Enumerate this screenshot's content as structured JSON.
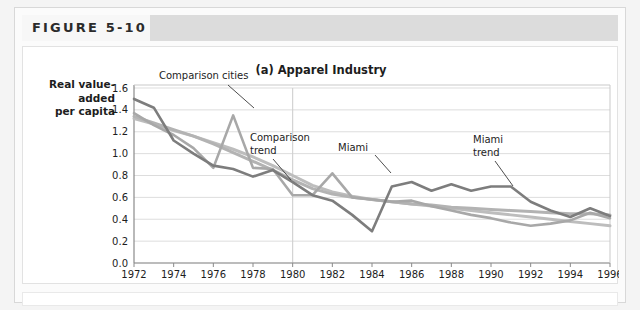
{
  "figure": {
    "label": "FIGURE 5-10"
  },
  "chart_data": {
    "type": "line",
    "title": "(a) Apparel Industry",
    "ylabel": "Real value-\nadded\nper capita",
    "xlabel": "",
    "xlim": [
      1972,
      1996
    ],
    "ylim": [
      0.0,
      1.6
    ],
    "grid": true,
    "legend_position": "inline-annotations",
    "yticks": [
      "0.0",
      "0.2",
      "0.4",
      "0.6",
      "0.8",
      "1.0",
      "1.2",
      "1.4",
      "1.6"
    ],
    "ytick_values": [
      0.0,
      0.2,
      0.4,
      0.6,
      0.8,
      1.0,
      1.2,
      1.4,
      1.6
    ],
    "xticks": [
      "1972",
      "1974",
      "1976",
      "1978",
      "1980",
      "1982",
      "1984",
      "1986",
      "1988",
      "1990",
      "1992",
      "1994",
      "1996"
    ],
    "xtick_values": [
      1972,
      1974,
      1976,
      1978,
      1980,
      1982,
      1984,
      1986,
      1988,
      1990,
      1992,
      1994,
      1996
    ],
    "x": [
      1972,
      1973,
      1974,
      1975,
      1976,
      1977,
      1978,
      1979,
      1980,
      1981,
      1982,
      1983,
      1984,
      1985,
      1986,
      1987,
      1988,
      1989,
      1990,
      1991,
      1992,
      1993,
      1994,
      1995,
      1996
    ],
    "reference_line": {
      "x": 1980,
      "label": ""
    },
    "series": [
      {
        "name": "Miami",
        "color": "#7d7d7d",
        "width": 2.6,
        "values": [
          1.5,
          1.42,
          1.12,
          1.0,
          0.89,
          0.86,
          0.79,
          0.85,
          0.74,
          0.62,
          0.57,
          0.44,
          0.29,
          0.7,
          0.74,
          0.66,
          0.72,
          0.66,
          0.7,
          0.7,
          0.56,
          0.48,
          0.42,
          0.5,
          0.43
        ]
      },
      {
        "name": "Comparison cities",
        "color": "#a8a8a8",
        "width": 2.6,
        "values": [
          1.37,
          1.26,
          1.17,
          1.05,
          0.87,
          1.35,
          0.87,
          0.86,
          0.62,
          0.62,
          0.82,
          0.6,
          0.58,
          0.56,
          0.57,
          0.52,
          0.48,
          0.44,
          0.41,
          0.37,
          0.34,
          0.36,
          0.39,
          0.46,
          0.41
        ]
      },
      {
        "name": "Comparison trend",
        "color": "#bdbdbd",
        "width": 3.0,
        "values": [
          1.32,
          1.27,
          1.21,
          1.16,
          1.1,
          1.04,
          0.97,
          0.89,
          0.8,
          0.71,
          0.65,
          0.61,
          0.58,
          0.56,
          0.54,
          0.52,
          0.5,
          0.48,
          0.46,
          0.44,
          0.42,
          0.4,
          0.38,
          0.36,
          0.34
        ]
      },
      {
        "name": "Miami trend",
        "color": "#b3b3b3",
        "width": 3.0,
        "values": [
          1.34,
          1.28,
          1.22,
          1.16,
          1.09,
          1.01,
          0.93,
          0.85,
          0.76,
          0.68,
          0.63,
          0.6,
          0.58,
          0.56,
          0.54,
          0.53,
          0.51,
          0.5,
          0.49,
          0.48,
          0.47,
          0.46,
          0.45,
          0.45,
          0.44
        ]
      }
    ],
    "annotations": [
      {
        "name": "comparison-cities",
        "text": "Comparison cities",
        "x": 136,
        "y": 32
      },
      {
        "name": "comparison-trend",
        "text": "Comparison\ntrend",
        "x": 227,
        "y": 94
      },
      {
        "name": "miami",
        "text": "Miami",
        "x": 315,
        "y": 104
      },
      {
        "name": "miami-trend",
        "text": "Miami\ntrend",
        "x": 450,
        "y": 96
      }
    ]
  }
}
